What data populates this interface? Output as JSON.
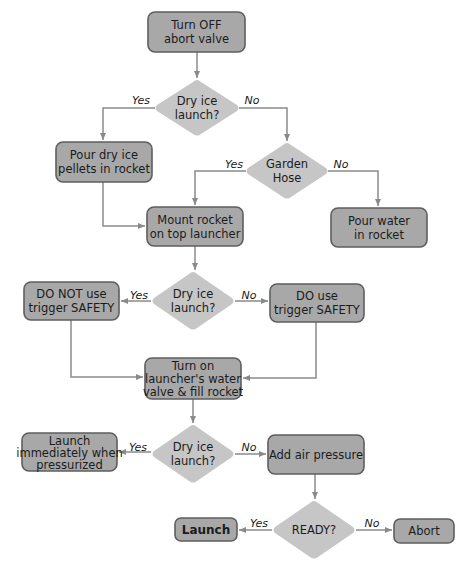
{
  "diagram": {
    "type": "flowchart",
    "nodes": {
      "n1": {
        "shape": "process",
        "lines": [
          "Turn OFF",
          "abort valve"
        ]
      },
      "d1": {
        "shape": "decision",
        "lines": [
          "Dry ice",
          "launch?"
        ]
      },
      "n2": {
        "shape": "process",
        "lines": [
          "Pour dry ice",
          "pellets in rocket"
        ]
      },
      "d2": {
        "shape": "decision",
        "lines": [
          "Garden",
          "Hose"
        ]
      },
      "n3": {
        "shape": "process",
        "lines": [
          "Mount rocket",
          "on top launcher"
        ]
      },
      "n4": {
        "shape": "process",
        "lines": [
          "Pour water",
          "in rocket"
        ]
      },
      "d3": {
        "shape": "decision",
        "lines": [
          "Dry ice",
          "launch?"
        ]
      },
      "n5": {
        "shape": "process",
        "lines": [
          "DO NOT use",
          "trigger SAFETY"
        ]
      },
      "n6": {
        "shape": "process",
        "lines": [
          "DO use",
          "trigger SAFETY"
        ]
      },
      "n7": {
        "shape": "process",
        "lines": [
          "Turn on",
          "launcher's water",
          "valve & fill rocket"
        ]
      },
      "d4": {
        "shape": "decision",
        "lines": [
          "Dry ice",
          "launch?"
        ]
      },
      "n8": {
        "shape": "process",
        "lines": [
          "Launch",
          "immediately when",
          "pressurized"
        ]
      },
      "n9": {
        "shape": "process",
        "lines": [
          "Add air pressure"
        ]
      },
      "d5": {
        "shape": "decision",
        "lines": [
          "READY?"
        ]
      },
      "n10": {
        "shape": "terminal",
        "lines": [
          "Launch"
        ]
      },
      "n11": {
        "shape": "terminal",
        "lines": [
          "Abort"
        ]
      }
    },
    "branch_labels": {
      "yes": "Yes",
      "no": "No"
    },
    "edges": [
      {
        "from": "n1",
        "to": "d1",
        "label": ""
      },
      {
        "from": "d1",
        "to": "n2",
        "label": "Yes"
      },
      {
        "from": "d1",
        "to": "d2",
        "label": "No"
      },
      {
        "from": "d2",
        "to": "n3",
        "label": "Yes"
      },
      {
        "from": "d2",
        "to": "n4",
        "label": "No"
      },
      {
        "from": "n2",
        "to": "n3",
        "label": ""
      },
      {
        "from": "n3",
        "to": "d3",
        "label": ""
      },
      {
        "from": "d3",
        "to": "n5",
        "label": "Yes"
      },
      {
        "from": "d3",
        "to": "n6",
        "label": "No"
      },
      {
        "from": "n5",
        "to": "n7",
        "label": ""
      },
      {
        "from": "n6",
        "to": "n7",
        "label": ""
      },
      {
        "from": "n7",
        "to": "d4",
        "label": ""
      },
      {
        "from": "d4",
        "to": "n8",
        "label": "Yes"
      },
      {
        "from": "d4",
        "to": "n9",
        "label": "No"
      },
      {
        "from": "n9",
        "to": "d5",
        "label": ""
      },
      {
        "from": "d5",
        "to": "n10",
        "label": "Yes"
      },
      {
        "from": "d5",
        "to": "n11",
        "label": "No"
      }
    ],
    "colors": {
      "process_fill": "#a8a8a8",
      "process_border": "#5e5e5e",
      "decision_fill": "#c6c6c6",
      "connector": "#8a8a8a",
      "text": "#1b1b1b"
    }
  }
}
